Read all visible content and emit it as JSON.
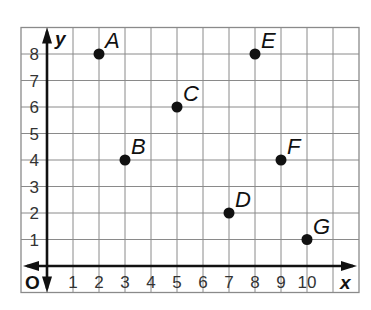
{
  "chart_data": {
    "type": "scatter",
    "title": "",
    "xlabel": "x",
    "ylabel": "y",
    "origin_label": "O",
    "xlim": [
      -1,
      12
    ],
    "ylim": [
      -1,
      9
    ],
    "grid": true,
    "legend": null,
    "x_ticks": [
      "1",
      "2",
      "3",
      "4",
      "5",
      "6",
      "7",
      "8",
      "9",
      "10"
    ],
    "y_ticks": [
      "1",
      "2",
      "3",
      "4",
      "5",
      "6",
      "7",
      "8"
    ],
    "points": [
      {
        "label": "A",
        "x": 2,
        "y": 8
      },
      {
        "label": "B",
        "x": 3,
        "y": 4
      },
      {
        "label": "C",
        "x": 5,
        "y": 6
      },
      {
        "label": "D",
        "x": 7,
        "y": 2
      },
      {
        "label": "E",
        "x": 8,
        "y": 8
      },
      {
        "label": "F",
        "x": 9,
        "y": 4
      },
      {
        "label": "G",
        "x": 10,
        "y": 1
      }
    ]
  },
  "colors": {
    "grid": "#8a8a8a",
    "axis": "#111111",
    "point": "#111111",
    "background": "#ffffff"
  }
}
